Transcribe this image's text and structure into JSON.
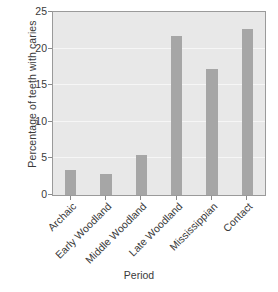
{
  "chart_data": {
    "type": "bar",
    "title": "",
    "xlabel": "Period",
    "ylabel": "Percentage of teeth with caries",
    "categories": [
      "Archaic",
      "Early Woodland",
      "Middle Woodland",
      "Late Woodland",
      "Mississippian",
      "Contact"
    ],
    "values": [
      3.4,
      2.9,
      5.5,
      21.7,
      17.2,
      22.7
    ],
    "ylim": [
      0,
      25
    ],
    "yticks": [
      0,
      5,
      10,
      15,
      20,
      25
    ],
    "ytick_labels": [
      "0",
      "5",
      "10",
      "15",
      "20",
      "25"
    ],
    "grid": true,
    "legend": null,
    "bar_color": "#a6a6a6",
    "plot_background": "#e8e8e8",
    "gridline_color": "#f6f6f6",
    "axis_color": "#9a9a9a",
    "xtick_rotation": -45
  }
}
